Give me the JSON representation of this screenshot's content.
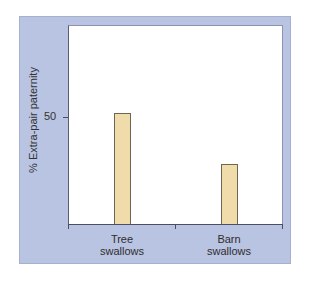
{
  "chart_data": {
    "type": "bar",
    "title": "",
    "xlabel": "",
    "ylabel": "% Extra-pair paternity",
    "categories": [
      "Tree swallows",
      "Barn swallows"
    ],
    "category_lines": [
      [
        "Tree",
        "swallows"
      ],
      [
        "Barn",
        "swallows"
      ]
    ],
    "values": [
      52,
      28
    ],
    "yticks": [
      50
    ],
    "ytick_labels": [
      "50"
    ],
    "ylim": [
      0,
      93
    ],
    "grid": false,
    "legend": null,
    "colors": {
      "bar": "#f0dcaa",
      "panel": "#b9c3e2",
      "plot_bg": "#ffffff"
    }
  }
}
